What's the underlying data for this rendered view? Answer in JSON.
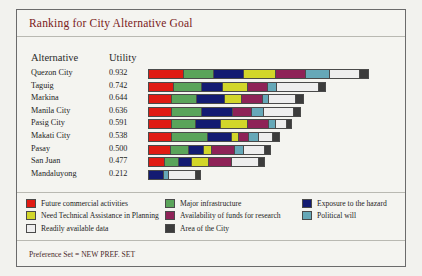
{
  "window": {
    "background": "#f2f2ee"
  },
  "panel": {
    "title": "Ranking for City Alternative Goal",
    "title_color": "#7a2020",
    "footer": "Preference Set = NEW PREF. SET"
  },
  "table": {
    "headers": {
      "alternative": "Alternative",
      "utility": "Utility"
    }
  },
  "legend": {
    "columns": [
      [
        {
          "label": "Future commercial activities",
          "color": "#e01b13"
        },
        {
          "label": "Need Technical Assistance in Planning",
          "color": "#d2d62a"
        },
        {
          "label": "Readily available data",
          "color": "#eeeeee"
        }
      ],
      [
        {
          "label": "Major infrastructure",
          "color": "#5aa45a"
        },
        {
          "label": "Availability of funds for research",
          "color": "#8e2257"
        },
        {
          "label": "Area of the City",
          "color": "#3c3c3c"
        }
      ],
      [
        {
          "label": "Exposure to the hazard",
          "color": "#131b72"
        },
        {
          "label": "Political will",
          "color": "#66a8b8"
        }
      ]
    ]
  },
  "chart_data": {
    "type": "bar",
    "orientation": "horizontal",
    "stacked": true,
    "title": "Ranking for City Alternative Goal",
    "xlabel": "",
    "ylabel": "Alternative",
    "value_label": "Utility",
    "grid": false,
    "legend_position": "bottom",
    "xlim": [
      0,
      1.0
    ],
    "categories": [
      "Quezon City",
      "Taguig",
      "Markina",
      "Manila City",
      "Pasig City",
      "Makati City",
      "Pasay",
      "San Juan",
      "Mandaluyong"
    ],
    "values": [
      0.932,
      0.742,
      0.644,
      0.636,
      0.591,
      0.538,
      0.5,
      0.477,
      0.212
    ],
    "series": [
      {
        "name": "Future commercial activities",
        "color": "#e01b13",
        "values": [
          0.15,
          0.105,
          0.098,
          0.095,
          0.098,
          0.098,
          0.09,
          0.065,
          0.0
        ]
      },
      {
        "name": "Major infrastructure",
        "color": "#5aa45a",
        "values": [
          0.128,
          0.118,
          0.105,
          0.13,
          0.098,
          0.15,
          0.078,
          0.06,
          0.0
        ]
      },
      {
        "name": "Exposure to the hazard",
        "color": "#131b72",
        "values": [
          0.125,
          0.088,
          0.118,
          0.13,
          0.105,
          0.105,
          0.062,
          0.052,
          0.062
        ]
      },
      {
        "name": "Need Technical Assistance in Planning",
        "color": "#d2d62a",
        "values": [
          0.138,
          0.105,
          0.068,
          0.0,
          0.118,
          0.025,
          0.03,
          0.068,
          0.0
        ]
      },
      {
        "name": "Availability of funds for research",
        "color": "#8e2257",
        "values": [
          0.128,
          0.085,
          0.09,
          0.078,
          0.085,
          0.04,
          0.095,
          0.095,
          0.0
        ]
      },
      {
        "name": "Political will",
        "color": "#66a8b8",
        "values": [
          0.098,
          0.035,
          0.022,
          0.048,
          0.025,
          0.04,
          0.035,
          0.0,
          0.018
        ]
      },
      {
        "name": "Readily available data",
        "color": "#eeeeee",
        "values": [
          0.128,
          0.178,
          0.115,
          0.13,
          0.045,
          0.055,
          0.088,
          0.115,
          0.115
        ]
      },
      {
        "name": "Area of the City",
        "color": "#3c3c3c",
        "values": [
          0.037,
          0.028,
          0.028,
          0.025,
          0.017,
          0.025,
          0.022,
          0.022,
          0.017
        ]
      }
    ]
  }
}
